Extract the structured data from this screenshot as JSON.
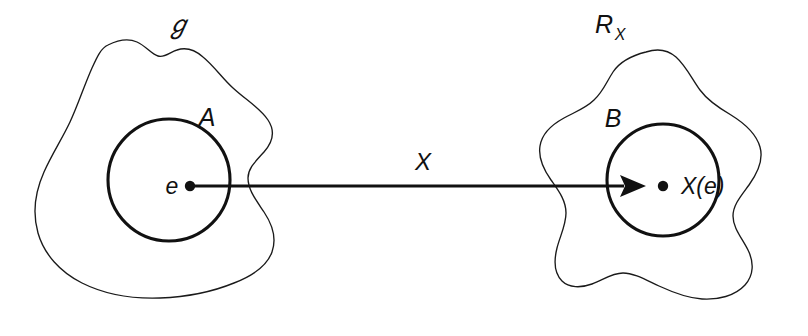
{
  "figure": {
    "kind": "random-variable-mapping-diagram",
    "background_color": "#ffffff",
    "ink_color": "#111111"
  },
  "domain_region": {
    "space_label": "ℊ",
    "space_label_plain": "S",
    "subset_label": "A",
    "element_label": "e"
  },
  "range_region": {
    "space_label_base": "R",
    "space_label_sub": "X",
    "subset_label": "B",
    "element_label": "X(e)"
  },
  "mapping": {
    "label": "X"
  }
}
